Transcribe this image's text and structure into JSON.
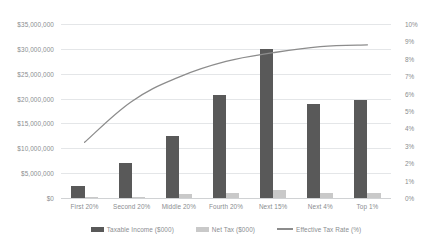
{
  "chart_data": {
    "type": "bar",
    "title": "",
    "subtitle": "",
    "xlabel": "",
    "ylabel": "",
    "grid": true,
    "legend_position": "bottom",
    "categories": [
      "First 20%",
      "Second 20%",
      "Middle 20%",
      "Fourth 20%",
      "Next 15%",
      "Next 4%",
      "Top 1%"
    ],
    "y_left": {
      "label": "",
      "ylim": [
        0,
        35000000
      ],
      "tick_step": 5000000,
      "tick_labels": [
        "$35,000,000",
        "$30,000,000",
        "$25,000,000",
        "$20,000,000",
        "$15,000,000",
        "$10,000,000",
        "$5,000,000",
        "$0"
      ],
      "tick_values": [
        35000000,
        30000000,
        25000000,
        20000000,
        15000000,
        10000000,
        5000000,
        0
      ]
    },
    "y_right": {
      "label": "",
      "ylim": [
        0,
        10
      ],
      "tick_step": 1,
      "tick_labels": [
        "10%",
        "9%",
        "8%",
        "7%",
        "6%",
        "5%",
        "4%",
        "3%",
        "2%",
        "1%",
        "0%"
      ],
      "tick_values": [
        10,
        9,
        8,
        7,
        6,
        5,
        4,
        3,
        2,
        1,
        0
      ]
    },
    "series": [
      {
        "name": "Taxable Income ($000)",
        "kind": "bar",
        "axis": "left",
        "color": "#595959",
        "values": [
          2400000,
          7100000,
          12500000,
          20800000,
          30000000,
          18900000,
          19800000
        ]
      },
      {
        "name": "Net Tax ($000)",
        "kind": "bar",
        "axis": "left",
        "color": "#c9c9c9",
        "values": [
          60000,
          200000,
          800000,
          1100000,
          1700000,
          1000000,
          1100000
        ]
      },
      {
        "name": "Effective Tax Rate (%)",
        "kind": "line",
        "axis": "right",
        "color": "#8c8c8c",
        "values": [
          3.2,
          5.55,
          6.95,
          7.85,
          8.35,
          8.7,
          8.8
        ]
      }
    ]
  },
  "legend": {
    "entries": [
      {
        "label": "Taxable Income ($000)",
        "marker": "bar-swatch-dark",
        "color": "#595959"
      },
      {
        "label": "Net Tax ($000)",
        "marker": "bar-swatch-light",
        "color": "#c9c9c9"
      },
      {
        "label": "Effective Tax Rate (%)",
        "marker": "line-swatch",
        "color": "#8c8c8c"
      }
    ]
  },
  "colors": {
    "taxable_income": "#595959",
    "net_tax": "#c9c9c9",
    "effective_tax_rate": "#8c8c8c",
    "gridline": "#e4e6e8",
    "axis_text": "#8a8d90",
    "background": "#ffffff"
  }
}
